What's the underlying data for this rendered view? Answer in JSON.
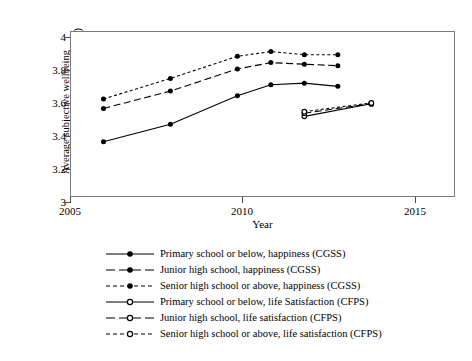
{
  "chart_data": {
    "type": "line",
    "title": "",
    "xlabel": "Year",
    "ylabel_line1": "Average subjective wellbeing",
    "ylabel_line2": "(scale of 1 to 5, 3-year moving average)",
    "xlim": [
      2005,
      2016.5
    ],
    "ylim": [
      3,
      4.05
    ],
    "xticks": [
      2005,
      2010,
      2015
    ],
    "xtick_labels": [
      "2005",
      "2010",
      "2015"
    ],
    "yticks": [
      3,
      3.2,
      3.4,
      3.6,
      3.8,
      4
    ],
    "ytick_labels": [
      "3",
      "3.2",
      "3.4",
      "3.6",
      "3.8",
      "4"
    ],
    "grid": false,
    "legend_position": "below",
    "series": [
      {
        "name": "Primary school or below, happiness (CGSS)",
        "dataset": "CGSS",
        "marker": "filled-circle",
        "linestyle": "solid",
        "x": [
          2006,
          2008,
          2010,
          2011,
          2012,
          2013
        ],
        "values": [
          3.35,
          3.46,
          3.64,
          3.71,
          3.72,
          3.7
        ]
      },
      {
        "name": "Junior high school, happiness (CGSS)",
        "dataset": "CGSS",
        "marker": "filled-circle",
        "linestyle": "long-dash",
        "x": [
          2006,
          2008,
          2010,
          2011,
          2012,
          2013
        ],
        "values": [
          3.56,
          3.67,
          3.81,
          3.85,
          3.84,
          3.83
        ]
      },
      {
        "name": "Senior high school or above, happiness (CGSS)",
        "dataset": "CGSS",
        "marker": "filled-circle",
        "linestyle": "short-dash",
        "x": [
          2006,
          2008,
          2010,
          2011,
          2012,
          2013
        ],
        "values": [
          3.62,
          3.75,
          3.89,
          3.92,
          3.9,
          3.9
        ]
      },
      {
        "name": "Primary school or below, life Satisfaction (CFPS)",
        "dataset": "CFPS",
        "marker": "open-circle",
        "linestyle": "solid",
        "x": [
          2012,
          2014
        ],
        "values": [
          3.51,
          3.59
        ]
      },
      {
        "name": "Junior high school, life satisfaction (CFPS)",
        "dataset": "CFPS",
        "marker": "open-circle",
        "linestyle": "long-dash",
        "x": [
          2012,
          2014
        ],
        "values": [
          3.53,
          3.59
        ]
      },
      {
        "name": "Senior high school or above, life satisfaction (CFPS)",
        "dataset": "CFPS",
        "marker": "open-circle",
        "linestyle": "short-dash",
        "x": [
          2012,
          2014
        ],
        "values": [
          3.54,
          3.595
        ]
      }
    ]
  },
  "axis": {
    "y_label_line1": "Average subjective wellbeing",
    "y_label_line2": "(scale of 1 to 5, 3-year moving average)",
    "x_label": "Year",
    "ytick_0": "3",
    "ytick_1": "3.2",
    "ytick_2": "3.4",
    "ytick_3": "3.6",
    "ytick_4": "3.8",
    "ytick_5": "4",
    "xtick_0": "2005",
    "xtick_1": "2010",
    "xtick_2": "2015"
  },
  "legend": {
    "items": [
      {
        "label": "Primary school or below, happiness (CGSS)"
      },
      {
        "label": "Junior high school, happiness (CGSS)"
      },
      {
        "label": "Senior high school or above, happiness (CGSS)"
      },
      {
        "label": "Primary school or below, life Satisfaction (CFPS)"
      },
      {
        "label": "Junior high school, life satisfaction (CFPS)"
      },
      {
        "label": "Senior high school or above, life satisfaction (CFPS)"
      }
    ]
  },
  "colors": {
    "line": "#000000",
    "frame": "#7a7a7a",
    "background": "#ffffff"
  }
}
